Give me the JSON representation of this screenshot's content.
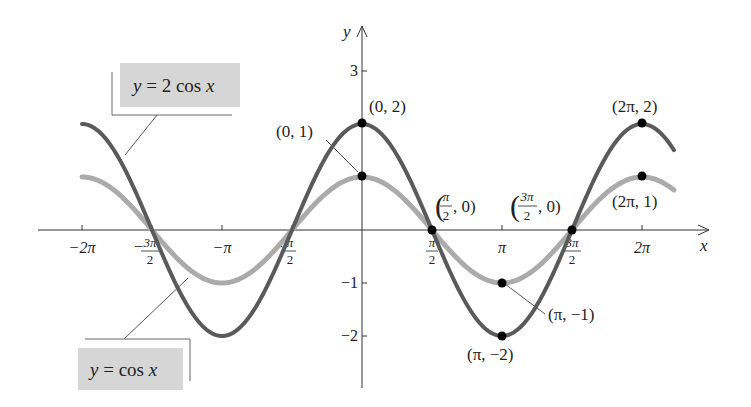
{
  "chart_data": {
    "type": "line",
    "title": "",
    "xlabel": "x",
    "ylabel": "y",
    "xlim": [
      -6.2832,
      7.1
    ],
    "ylim": [
      -2.6,
      3.5
    ],
    "grid": false,
    "x_ticks": [
      {
        "value": -6.2832,
        "label": "−2π"
      },
      {
        "value": -4.7124,
        "label": "−3π/2",
        "num": "3π",
        "den": "2",
        "neg": true
      },
      {
        "value": -3.1416,
        "label": "−π"
      },
      {
        "value": -1.5708,
        "label": "−π/2",
        "num": "π",
        "den": "2",
        "neg": true
      },
      {
        "value": 1.5708,
        "label": "π/2",
        "num": "π",
        "den": "2",
        "neg": false
      },
      {
        "value": 3.1416,
        "label": "π"
      },
      {
        "value": 4.7124,
        "label": "3π/2",
        "num": "3π",
        "den": "2",
        "neg": false
      },
      {
        "value": 6.2832,
        "label": "2π"
      }
    ],
    "y_ticks": [
      {
        "value": 3,
        "label": "3"
      },
      {
        "value": -1,
        "label": "−1"
      },
      {
        "value": -2,
        "label": "−2"
      }
    ],
    "series": [
      {
        "name": "y = 2 cos x",
        "function": "2*cos(x)",
        "color": "#5a5a5a",
        "x_range": [
          -6.2832,
          7.0
        ],
        "key_points": [
          [
            0,
            2
          ],
          [
            1.5708,
            0
          ],
          [
            3.1416,
            -2
          ],
          [
            4.7124,
            0
          ],
          [
            6.2832,
            2
          ]
        ]
      },
      {
        "name": "y = cos x",
        "function": "cos(x)",
        "color": "#ababab",
        "x_range": [
          -6.2832,
          7.0
        ],
        "key_points": [
          [
            0,
            1
          ],
          [
            1.5708,
            0
          ],
          [
            3.1416,
            -1
          ],
          [
            4.7124,
            0
          ],
          [
            6.2832,
            1
          ]
        ]
      }
    ],
    "annotations": [
      {
        "text": "(0, 2)",
        "x": 0,
        "y": 2
      },
      {
        "text": "(0, 1)",
        "x": 0,
        "y": 1
      },
      {
        "text": "(π/2, 0)",
        "x": 1.5708,
        "y": 0
      },
      {
        "text": "(3π/2, 0)",
        "x": 4.7124,
        "y": 0
      },
      {
        "text": "(2π, 2)",
        "x": 6.2832,
        "y": 2
      },
      {
        "text": "(2π, 1)",
        "x": 6.2832,
        "y": 1
      },
      {
        "text": "(π, −1)",
        "x": 3.1416,
        "y": -1
      },
      {
        "text": "(π, −2)",
        "x": 3.1416,
        "y": -2
      }
    ],
    "legend": [
      {
        "text": "y = 2 cos x",
        "position": "upper-left",
        "series": 0
      },
      {
        "text": "y = cos x",
        "position": "lower-left",
        "series": 1
      }
    ]
  },
  "labels": {
    "x_axis": "x",
    "y_axis": "y",
    "legend_2cos": {
      "y": "y",
      "eq": " = 2 cos ",
      "x": "x"
    },
    "legend_cos": {
      "y": "y",
      "eq": " = cos ",
      "x": "x"
    },
    "pt_0_2": "(0, 2)",
    "pt_0_1": "(0, 1)",
    "pt_2pi_2": "(2π, 2)",
    "pt_2pi_1": "(2π, 1)",
    "pt_pi_m1": "(π, −1)",
    "pt_pi_m2": "(π, −2)",
    "pt_pi2_0": {
      "num": "π",
      "den": "2",
      "rest": ", 0)"
    },
    "pt_3pi2_0": {
      "num": "3π",
      "den": "2",
      "rest": ", 0)"
    }
  },
  "style": {
    "dark_curve": "#5a5a5a",
    "light_curve": "#ababab",
    "box_fill": "#d6d6d6",
    "axis": "#333333"
  }
}
